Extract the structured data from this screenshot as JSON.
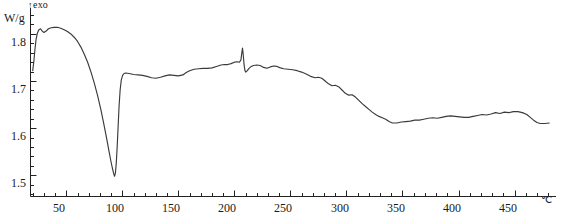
{
  "chart_data": {
    "type": "line",
    "title": "",
    "xlabel": "",
    "ylabel": "W/g",
    "x_unit": "℃",
    "y_unit": "W/g",
    "exo_annotation": "exo",
    "exo_arrow": "↑",
    "xlim": [
      18,
      487
    ],
    "ylim": [
      1.455,
      1.855
    ],
    "grid": false,
    "legend": "none",
    "x_ticks_major": [
      50,
      100,
      150,
      200,
      250,
      300,
      350,
      400,
      450
    ],
    "x_tick_labels": [
      "50",
      "100",
      "150",
      "200",
      "250",
      "300",
      "350",
      "400",
      "450"
    ],
    "x_minor_step": 10,
    "y_ticks_major": [
      1.5,
      1.6,
      1.7,
      1.8
    ],
    "y_tick_labels": [
      "1.5",
      "1.6",
      "1.7",
      "1.8"
    ],
    "y_minor_step": 0.02,
    "series": [
      {
        "name": "DSC heat flow",
        "points": [
          [
            20.0,
            1.722
          ],
          [
            21.0,
            1.742
          ],
          [
            22.0,
            1.768
          ],
          [
            23.0,
            1.789
          ],
          [
            24.2,
            1.802
          ],
          [
            25.5,
            1.809
          ],
          [
            27.0,
            1.811
          ],
          [
            28.5,
            1.806
          ],
          [
            30.0,
            1.803
          ],
          [
            32.0,
            1.806
          ],
          [
            34.0,
            1.811
          ],
          [
            36.5,
            1.813
          ],
          [
            39.0,
            1.814
          ],
          [
            42.0,
            1.814
          ],
          [
            45.0,
            1.812
          ],
          [
            48.0,
            1.809
          ],
          [
            51.0,
            1.805
          ],
          [
            54.0,
            1.8
          ],
          [
            57.0,
            1.793
          ],
          [
            60.0,
            1.784
          ],
          [
            63.0,
            1.772
          ],
          [
            66.0,
            1.757
          ],
          [
            69.0,
            1.74
          ],
          [
            72.0,
            1.719
          ],
          [
            75.0,
            1.695
          ],
          [
            78.0,
            1.668
          ],
          [
            81.0,
            1.637
          ],
          [
            83.5,
            1.608
          ],
          [
            86.0,
            1.578
          ],
          [
            88.0,
            1.552
          ],
          [
            89.5,
            1.533
          ],
          [
            91.0,
            1.516
          ],
          [
            92.2,
            1.504
          ],
          [
            93.0,
            1.498
          ],
          [
            93.8,
            1.505
          ],
          [
            94.6,
            1.528
          ],
          [
            95.4,
            1.562
          ],
          [
            96.2,
            1.603
          ],
          [
            97.0,
            1.645
          ],
          [
            98.0,
            1.681
          ],
          [
            99.0,
            1.702
          ],
          [
            100.2,
            1.712
          ],
          [
            101.5,
            1.716
          ],
          [
            103.0,
            1.717
          ],
          [
            106.0,
            1.716
          ],
          [
            110.0,
            1.714
          ],
          [
            114.0,
            1.713
          ],
          [
            118.0,
            1.712
          ],
          [
            122.0,
            1.71
          ],
          [
            126.0,
            1.707
          ],
          [
            130.0,
            1.706
          ],
          [
            134.0,
            1.708
          ],
          [
            138.0,
            1.711
          ],
          [
            142.0,
            1.713
          ],
          [
            146.0,
            1.712
          ],
          [
            150.0,
            1.711
          ],
          [
            154.0,
            1.713
          ],
          [
            157.0,
            1.718
          ],
          [
            160.0,
            1.722
          ],
          [
            164.0,
            1.725
          ],
          [
            168.0,
            1.726
          ],
          [
            172.0,
            1.727
          ],
          [
            176.0,
            1.727
          ],
          [
            180.0,
            1.728
          ],
          [
            184.0,
            1.731
          ],
          [
            188.0,
            1.734
          ],
          [
            191.0,
            1.735
          ],
          [
            194.0,
            1.735
          ],
          [
            197.0,
            1.737
          ],
          [
            200.0,
            1.74
          ],
          [
            202.5,
            1.741
          ],
          [
            204.5,
            1.74
          ],
          [
            205.8,
            1.745
          ],
          [
            206.6,
            1.76
          ],
          [
            207.2,
            1.77
          ],
          [
            207.8,
            1.757
          ],
          [
            208.6,
            1.735
          ],
          [
            209.4,
            1.722
          ],
          [
            210.2,
            1.719
          ],
          [
            211.5,
            1.722
          ],
          [
            213.0,
            1.727
          ],
          [
            215.0,
            1.731
          ],
          [
            217.0,
            1.733
          ],
          [
            220.0,
            1.734
          ],
          [
            223.0,
            1.733
          ],
          [
            226.0,
            1.729
          ],
          [
            229.0,
            1.727
          ],
          [
            232.0,
            1.73
          ],
          [
            235.0,
            1.732
          ],
          [
            238.0,
            1.731
          ],
          [
            241.0,
            1.728
          ],
          [
            244.0,
            1.726
          ],
          [
            248.0,
            1.725
          ],
          [
            252.0,
            1.724
          ],
          [
            256.0,
            1.722
          ],
          [
            260.0,
            1.719
          ],
          [
            264.0,
            1.715
          ],
          [
            268.0,
            1.71
          ],
          [
            272.0,
            1.707
          ],
          [
            275.0,
            1.708
          ],
          [
            278.0,
            1.706
          ],
          [
            281.0,
            1.7
          ],
          [
            284.0,
            1.694
          ],
          [
            287.0,
            1.69
          ],
          [
            290.0,
            1.691
          ],
          [
            293.0,
            1.688
          ],
          [
            296.0,
            1.681
          ],
          [
            299.0,
            1.674
          ],
          [
            302.0,
            1.67
          ],
          [
            305.0,
            1.671
          ],
          [
            308.0,
            1.666
          ],
          [
            311.0,
            1.659
          ],
          [
            314.0,
            1.652
          ],
          [
            317.0,
            1.646
          ],
          [
            320.0,
            1.64
          ],
          [
            323.0,
            1.634
          ],
          [
            326.0,
            1.629
          ],
          [
            329.0,
            1.625
          ],
          [
            332.0,
            1.622
          ],
          [
            335.0,
            1.619
          ],
          [
            338.0,
            1.614
          ],
          [
            341.0,
            1.611
          ],
          [
            345.0,
            1.611
          ],
          [
            349.0,
            1.613
          ],
          [
            353.0,
            1.614
          ],
          [
            357.0,
            1.615
          ],
          [
            361.0,
            1.617
          ],
          [
            365.0,
            1.617
          ],
          [
            369.0,
            1.619
          ],
          [
            373.0,
            1.621
          ],
          [
            377.0,
            1.622
          ],
          [
            381.0,
            1.621
          ],
          [
            385.0,
            1.623
          ],
          [
            389.0,
            1.625
          ],
          [
            393.0,
            1.626
          ],
          [
            397.0,
            1.625
          ],
          [
            401.0,
            1.624
          ],
          [
            405.0,
            1.623
          ],
          [
            409.0,
            1.623
          ],
          [
            413.0,
            1.625
          ],
          [
            417.0,
            1.627
          ],
          [
            421.0,
            1.629
          ],
          [
            425.0,
            1.628
          ],
          [
            429.0,
            1.63
          ],
          [
            433.0,
            1.633
          ],
          [
            437.0,
            1.631
          ],
          [
            441.0,
            1.634
          ],
          [
            445.0,
            1.633
          ],
          [
            449.0,
            1.635
          ],
          [
            453.0,
            1.635
          ],
          [
            457.0,
            1.633
          ],
          [
            461.0,
            1.629
          ],
          [
            464.0,
            1.623
          ],
          [
            467.0,
            1.617
          ],
          [
            470.0,
            1.612
          ],
          [
            473.0,
            1.61
          ],
          [
            477.0,
            1.61
          ],
          [
            481.0,
            1.611
          ]
        ]
      }
    ],
    "features": {
      "endotherm_min_temp": 93,
      "endotherm_min_value": 1.498,
      "plateau_value": 1.715,
      "sharp_peak_temp": 207,
      "sharp_peak_value": 1.77,
      "baseline_tail_value": 1.61
    }
  }
}
